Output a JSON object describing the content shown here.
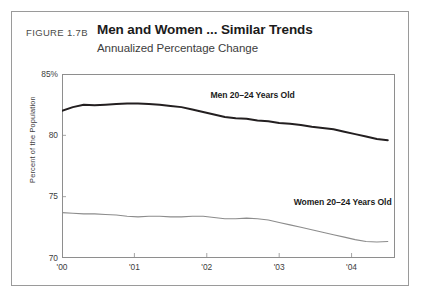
{
  "figure": {
    "number": "FIGURE 1.7B",
    "title": "Men and Women ... Similar Trends",
    "subtitle": "Annualized Percentage Change"
  },
  "chart_data": {
    "type": "line",
    "title": "Men and Women ... Similar Trends",
    "subtitle": "Annualized Percentage Change",
    "xlabel": "",
    "ylabel": "Percent of the Population",
    "ylim": [
      70,
      85
    ],
    "xlim": [
      2000.0,
      2004.6
    ],
    "grid": false,
    "legend_position": "inline-annotation",
    "y_ticks": [
      70,
      75,
      80,
      85
    ],
    "y_tick_labels": [
      "70",
      "75",
      "80",
      "85%"
    ],
    "x_ticks": [
      2000,
      2001,
      2002,
      2003,
      2004
    ],
    "x_tick_labels": [
      "'00",
      "'01",
      "'02",
      "'03",
      "'04"
    ],
    "x": [
      2000.0,
      2000.15,
      2000.3,
      2000.45,
      2000.6,
      2000.75,
      2000.9,
      2001.05,
      2001.2,
      2001.35,
      2001.5,
      2001.65,
      2001.8,
      2001.95,
      2002.1,
      2002.25,
      2002.4,
      2002.55,
      2002.7,
      2002.85,
      2003.0,
      2003.15,
      2003.3,
      2003.45,
      2003.6,
      2003.75,
      2003.9,
      2004.05,
      2004.2,
      2004.35,
      2004.5
    ],
    "series": [
      {
        "name": "Men 20-24 Years Old",
        "label": "Men 20–24 Years Old",
        "color": "#231f20",
        "values": [
          82.0,
          82.3,
          82.5,
          82.45,
          82.5,
          82.55,
          82.6,
          82.6,
          82.55,
          82.5,
          82.4,
          82.3,
          82.1,
          81.9,
          81.7,
          81.5,
          81.4,
          81.35,
          81.2,
          81.15,
          81.0,
          80.95,
          80.85,
          80.7,
          80.6,
          80.5,
          80.3,
          80.1,
          79.9,
          79.7,
          79.6
        ]
      },
      {
        "name": "Women 20-24 Years Old",
        "label": "Women 20–24 Years Old",
        "color": "#8c8c8c",
        "values": [
          73.7,
          73.65,
          73.6,
          73.6,
          73.55,
          73.5,
          73.4,
          73.35,
          73.4,
          73.4,
          73.35,
          73.35,
          73.4,
          73.4,
          73.3,
          73.2,
          73.2,
          73.25,
          73.2,
          73.1,
          72.9,
          72.7,
          72.5,
          72.3,
          72.1,
          71.9,
          71.7,
          71.5,
          71.35,
          71.3,
          71.35
        ]
      }
    ],
    "annotations": [
      {
        "text": "Men 20–24 Years Old",
        "x": 2002.05,
        "y": 82.6
      },
      {
        "text": "Women 20–24 Years Old",
        "x": 2003.2,
        "y": 73.9
      }
    ]
  }
}
